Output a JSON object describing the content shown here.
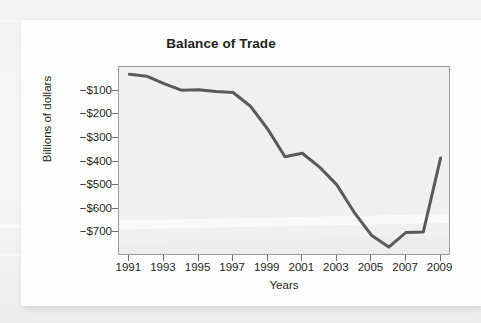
{
  "figure": {
    "y_axis_title": "Billions of dollars",
    "x_axis_title": "Years"
  },
  "chart_data": {
    "type": "line",
    "title": "Balance of Trade",
    "xlabel": "Years",
    "ylabel": "Billions of dollars",
    "xlim": [
      1990.4,
      2009.6
    ],
    "ylim": [
      -800,
      0
    ],
    "xtick_labels": [
      "1991",
      "1993",
      "1995",
      "1997",
      "1999",
      "2001",
      "2003",
      "2005",
      "2007",
      "2009"
    ],
    "xticks": [
      1991,
      1993,
      1995,
      1997,
      1999,
      2001,
      2003,
      2005,
      2007,
      2009
    ],
    "ytick_labels": [
      "−$100",
      "−$200",
      "−$300",
      "−$400",
      "−$500",
      "−$600",
      "−$700"
    ],
    "yticks": [
      -100,
      -200,
      -300,
      -400,
      -500,
      -600,
      -700
    ],
    "grid": false,
    "legend": false,
    "line_color": "#5a5a5a",
    "plot_background": "#f0f0f0",
    "x": [
      1991,
      1992,
      1993,
      1994,
      1995,
      1996,
      1997,
      1998,
      1999,
      2000,
      2001,
      2002,
      2003,
      2004,
      2005,
      2006,
      2007,
      2008,
      2009
    ],
    "values": [
      -31,
      -39,
      -70,
      -98,
      -96,
      -104,
      -108,
      -166,
      -263,
      -380,
      -365,
      -424,
      -499,
      -615,
      -712,
      -762,
      -700,
      -698,
      -385
    ],
    "series": [
      {
        "name": "Balance of Trade",
        "values": [
          -31,
          -39,
          -70,
          -98,
          -96,
          -104,
          -108,
          -166,
          -263,
          -380,
          -365,
          -424,
          -499,
          -615,
          -712,
          -762,
          -700,
          -698,
          -385
        ]
      }
    ]
  }
}
